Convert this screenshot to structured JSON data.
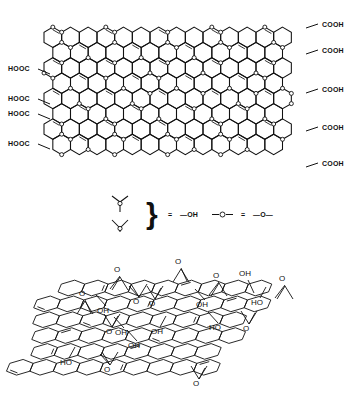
{
  "figure": {
    "title": "",
    "caption": "",
    "background_color": "#ffffff",
    "line_color": "#111111"
  },
  "top_structure": {
    "name": "graphite-oxide-planar-model",
    "description": "Planar hexagonal carbon lattice of graphite oxide with ether/hydroxyl oxygen circles distributed across the basal plane and carboxyl groups at the sheet edges.",
    "lattice": {
      "rows": 9,
      "cols": 14,
      "hex_radius": 10.2,
      "origin_x": 44,
      "origin_y": 22,
      "oxygen_circle_radius": 2.0,
      "oxygen_circle_count": 78
    },
    "left_labels": [
      {
        "text": "HOOC",
        "x": 8,
        "y": 71
      },
      {
        "text": "HOOC",
        "x": 8,
        "y": 101
      },
      {
        "text": "HOOC",
        "x": 8,
        "y": 116
      },
      {
        "text": "HOOC",
        "x": 8,
        "y": 146
      }
    ],
    "right_labels": [
      {
        "text": "COOH",
        "x": 322,
        "y": 27
      },
      {
        "text": "COOH",
        "x": 322,
        "y": 53
      },
      {
        "text": "COOH",
        "x": 322,
        "y": 92
      },
      {
        "text": "COOH",
        "x": 322,
        "y": 130
      },
      {
        "text": "COOH",
        "x": 322,
        "y": 166
      }
    ]
  },
  "legend": {
    "name": "structure-key",
    "brace": "}",
    "equals_1": "=",
    "hydroxyl_label": "—OH",
    "equals_2": "=",
    "ether_label": "—O—",
    "symbols": [
      {
        "name": "y-up-with-circle",
        "meaning": "—OH"
      },
      {
        "name": "y-down-with-circle",
        "meaning": "—OH"
      }
    ],
    "circle_symbol": {
      "name": "circle-in-bond",
      "meaning": "—O—"
    }
  },
  "bottom_structure": {
    "name": "graphite-oxide-perspective-model",
    "description": "Three-dimensional perspective drawing of a puckered graphene oxide sheet bearing epoxide (O bridge) and hydroxyl (OH / HO) functional groups on both faces.",
    "labels": [
      {
        "text": "O",
        "x": 117,
        "y": 272
      },
      {
        "text": "O",
        "x": 178,
        "y": 264
      },
      {
        "text": "O",
        "x": 216,
        "y": 278
      },
      {
        "text": "OH",
        "x": 245,
        "y": 276
      },
      {
        "text": "O",
        "x": 282,
        "y": 281
      },
      {
        "text": "O",
        "x": 82,
        "y": 296
      },
      {
        "text": "O",
        "x": 136,
        "y": 304
      },
      {
        "text": "O",
        "x": 152,
        "y": 306
      },
      {
        "text": "OH",
        "x": 202,
        "y": 307
      },
      {
        "text": "HO",
        "x": 257,
        "y": 305
      },
      {
        "text": "OH",
        "x": 103,
        "y": 313
      },
      {
        "text": "O",
        "x": 109,
        "y": 334
      },
      {
        "text": "OH",
        "x": 121,
        "y": 335
      },
      {
        "text": "OH",
        "x": 157,
        "y": 334
      },
      {
        "text": "HO",
        "x": 215,
        "y": 330
      },
      {
        "text": "O",
        "x": 246,
        "y": 331
      },
      {
        "text": "OH",
        "x": 134,
        "y": 348
      },
      {
        "text": "HO",
        "x": 66,
        "y": 365
      },
      {
        "text": "O",
        "x": 107,
        "y": 372
      },
      {
        "text": "O",
        "x": 196,
        "y": 386
      }
    ]
  }
}
